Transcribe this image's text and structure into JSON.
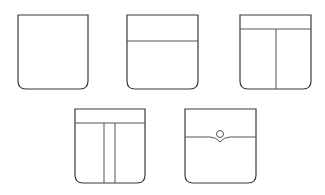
{
  "diagram": {
    "title": "",
    "stroke_color": "#3a3a3a",
    "background": "#ffffff",
    "pockets": [
      {
        "id": "plain",
        "label": "Plain pocket",
        "features": []
      },
      {
        "id": "flap-band",
        "label": "Pocket with top band",
        "features": [
          "horizontal-band"
        ]
      },
      {
        "id": "band-single-pleat",
        "label": "Pocket with band and center seam",
        "features": [
          "horizontal-band",
          "center-seam"
        ]
      },
      {
        "id": "band-box-pleat",
        "label": "Pocket with band and box pleat",
        "features": [
          "horizontal-band",
          "box-pleat"
        ]
      },
      {
        "id": "button-flap",
        "label": "Pocket with pointed flap and button",
        "features": [
          "pointed-flap",
          "button"
        ]
      }
    ]
  }
}
